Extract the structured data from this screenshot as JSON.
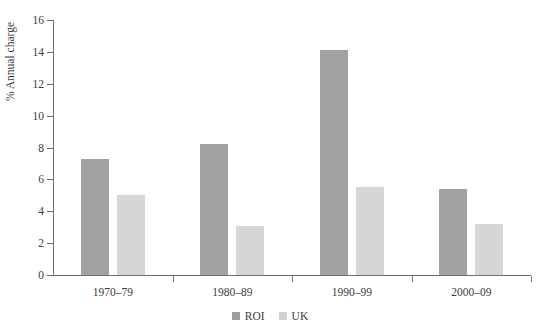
{
  "chart_data": {
    "type": "bar",
    "title": "",
    "xlabel": "",
    "ylabel": "% Annual charge",
    "categories": [
      "1970–79",
      "1980–89",
      "1990–99",
      "2000–09"
    ],
    "series": [
      {
        "name": "ROI",
        "color": "#a2a2a2",
        "values": [
          7.3,
          8.2,
          14.1,
          5.4
        ]
      },
      {
        "name": "UK",
        "color": "#d6d6d6",
        "values": [
          5.0,
          3.1,
          5.5,
          3.2
        ]
      }
    ],
    "ylim": [
      0,
      16
    ],
    "ytick_values": [
      0,
      2,
      4,
      6,
      8,
      10,
      12,
      14,
      16
    ],
    "ytick_labels": [
      "0",
      "2",
      "4",
      "6",
      "8",
      "10",
      "12",
      "14",
      "16"
    ],
    "grid": false,
    "legend_position": "bottom-center"
  },
  "legend": {
    "items": [
      {
        "label": "ROI"
      },
      {
        "label": "UK"
      }
    ]
  },
  "axis": {
    "y_label": "% Annual charge"
  },
  "colors": {
    "roi": "#a2a2a2",
    "uk": "#d6d6d6",
    "axis": "#6f6f6f",
    "text": "#3c3c3c"
  }
}
